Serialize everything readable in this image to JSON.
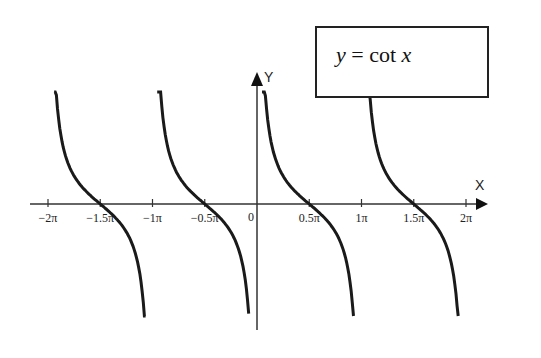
{
  "chart_data": {
    "type": "line",
    "title": "y = cot x",
    "title_parts": {
      "lhs": "y",
      "eq": " = cot ",
      "var": "x"
    },
    "xlabel": "X",
    "ylabel": "Y",
    "origin_label": "0",
    "x_ticks": [
      {
        "value": -6.2832,
        "label": "−2π"
      },
      {
        "value": -4.7124,
        "label": "−1.5π"
      },
      {
        "value": -3.1416,
        "label": "−1π"
      },
      {
        "value": -1.5708,
        "label": "−0.5π"
      },
      {
        "value": 1.5708,
        "label": "0.5π"
      },
      {
        "value": 3.1416,
        "label": "1π"
      },
      {
        "value": 4.7124,
        "label": "1.5π"
      },
      {
        "value": 6.2832,
        "label": "2π"
      }
    ],
    "xlim": [
      -6.8,
      7.0
    ],
    "ylim": [
      -4,
      4
    ],
    "grid": false,
    "legend": "boxed title upper right with leader line to curve",
    "series": [
      {
        "name": "cot x, branch (-2π, -π)",
        "x_range": [
          -6.1,
          -3.35
        ],
        "zero_at": -4.7124
      },
      {
        "name": "cot x, branch (-π, 0)",
        "x_range": [
          -3.0,
          -0.25
        ],
        "zero_at": -1.5708
      },
      {
        "name": "cot x, branch (0, π)",
        "x_range": [
          0.15,
          2.9
        ],
        "zero_at": 1.5708
      },
      {
        "name": "cot x, branch (π, 2π)",
        "x_range": [
          3.3,
          6.05
        ],
        "zero_at": 4.7124
      }
    ],
    "style": {
      "line_color": "#1a1a1a",
      "axis_color": "#333333",
      "background": "#ffffff"
    }
  }
}
